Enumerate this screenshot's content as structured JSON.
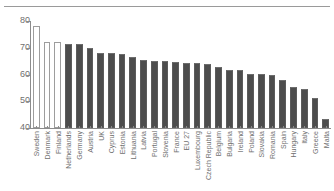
{
  "figure": {
    "has_top_rule": true,
    "background_color": "#ffffff",
    "bar_fill_color": "#4d4d4d",
    "bar_hollow_color": "#ffffff",
    "bar_outline_color": "#9d9d9d",
    "axis_color": "#8c8c8c",
    "tick_label_color": "#6f6f6f"
  },
  "chart_data": {
    "type": "bar",
    "title": "",
    "subtitle": "",
    "xlabel": "",
    "ylabel": "",
    "ylim": [
      40,
      80
    ],
    "yticks": [
      40,
      50,
      60,
      70,
      80
    ],
    "ytick_labels": [
      "40",
      "50",
      "60",
      "70",
      "80"
    ],
    "grid": false,
    "legend": null,
    "legend_position": "none",
    "annotations": [],
    "categories": [
      "Sweden",
      "Denmark",
      "Finland",
      "Netherlands",
      "Germany",
      "Austria",
      "UK",
      "Cyprus",
      "Estonia",
      "Lithuania",
      "Latvia",
      "Portugal",
      "Slovenia",
      "France",
      "EU 27",
      "Luxembourg",
      "Czech Republic",
      "Belgium",
      "Bulgaria",
      "Ireland",
      "Poland",
      "Slovakia",
      "Romania",
      "Spain",
      "Hungary",
      "Italy",
      "Greece",
      "Malta"
    ],
    "values": [
      78.0,
      72.3,
      72.0,
      71.5,
      71.3,
      69.8,
      68.0,
      67.9,
      67.8,
      66.7,
      65.4,
      65.2,
      65.2,
      64.6,
      64.4,
      64.2,
      64.1,
      62.9,
      61.7,
      61.6,
      60.3,
      60.2,
      59.9,
      58.1,
      55.4,
      54.5,
      51.2,
      43.2
    ],
    "bar_styles": [
      "hollow",
      "hollow",
      "hollow",
      "filled",
      "filled",
      "filled",
      "filled",
      "filled",
      "filled",
      "filled",
      "filled",
      "filled",
      "filled",
      "filled",
      "filled",
      "filled",
      "filled",
      "filled",
      "filled",
      "filled",
      "filled",
      "filled",
      "filled",
      "filled",
      "filled",
      "filled",
      "filled",
      "filled"
    ]
  }
}
